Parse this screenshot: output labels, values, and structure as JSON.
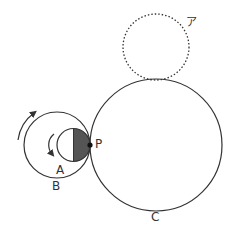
{
  "diagram": {
    "labels": {
      "a": "A",
      "b": "B",
      "c": "C",
      "p": "P",
      "dotted": "ア"
    },
    "colors": {
      "stroke": "#333333",
      "shade": "#555555",
      "background": "#ffffff"
    }
  }
}
